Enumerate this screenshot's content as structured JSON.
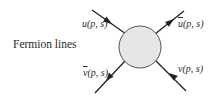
{
  "title": "Fermion lines",
  "blob": {
    "fill": "#e6e6e6",
    "stroke": "#555555"
  },
  "line_color": "#222222",
  "legs": [
    {
      "name": "incoming-fermion",
      "symbol": "u",
      "args": "(p, s)",
      "bar": false,
      "position": "top-left",
      "arrow": "toward-vertex"
    },
    {
      "name": "outgoing-fermion",
      "symbol": "u",
      "args": "(p, s)",
      "bar": true,
      "position": "top-right",
      "arrow": "away-from-vertex"
    },
    {
      "name": "outgoing-antifermion",
      "symbol": "v",
      "args": "(p, s)",
      "bar": true,
      "position": "bottom-left",
      "arrow": "away-from-vertex"
    },
    {
      "name": "incoming-antifermion",
      "symbol": "v",
      "args": "(p, s)",
      "bar": false,
      "position": "bottom-right",
      "arrow": "toward-vertex"
    }
  ]
}
